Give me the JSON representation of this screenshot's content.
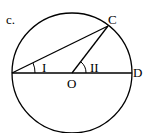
{
  "figure_label": "c.",
  "points": {
    "C": "C",
    "D": "D",
    "O": "O"
  },
  "angles": {
    "first": "I",
    "second": "II"
  },
  "colors": {
    "stroke": "#000000",
    "background": "#ffffff"
  }
}
